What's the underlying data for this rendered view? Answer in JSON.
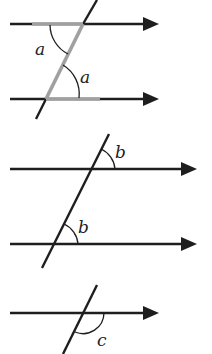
{
  "diagram": {
    "colors": {
      "line": "#1e1e1e",
      "highlight": "#a0a0a0",
      "background": "#ffffff"
    },
    "figures": [
      {
        "name": "alternate-angles",
        "angle_label": "a",
        "parallel_lines": 2,
        "highlight": "Z-shape"
      },
      {
        "name": "corresponding-angles",
        "angle_label": "b",
        "parallel_lines": 2,
        "highlight": "none"
      },
      {
        "name": "single-line-angle",
        "angle_label": "c",
        "parallel_lines": 1,
        "highlight": "none"
      }
    ]
  }
}
